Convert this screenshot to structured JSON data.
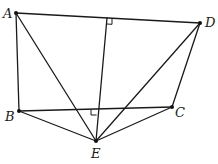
{
  "diagram": {
    "type": "geometry",
    "points": {
      "A": {
        "label": "A",
        "x": 16,
        "y": 13,
        "label_x": 3,
        "label_y": 18
      },
      "B": {
        "label": "B",
        "x": 19,
        "y": 111,
        "label_x": 5,
        "label_y": 121
      },
      "C": {
        "label": "C",
        "x": 172,
        "y": 107,
        "label_x": 175,
        "label_y": 116
      },
      "D": {
        "label": "D",
        "x": 200,
        "y": 23,
        "label_x": 205,
        "label_y": 27
      },
      "E": {
        "label": "E",
        "x": 96,
        "y": 141,
        "label_x": 91,
        "label_y": 158
      }
    },
    "segments": [
      [
        "A",
        "D"
      ],
      [
        "A",
        "B"
      ],
      [
        "B",
        "C"
      ],
      [
        "C",
        "D"
      ],
      [
        "A",
        "E"
      ],
      [
        "B",
        "E"
      ],
      [
        "C",
        "E"
      ],
      [
        "D",
        "E"
      ]
    ],
    "perpendiculars": [
      {
        "from": "E",
        "to_segment": [
          "A",
          "D"
        ],
        "foot": {
          "x": 107,
          "y": 18
        },
        "right_angle_mark": true
      },
      {
        "from": "E",
        "to_segment": [
          "B",
          "C"
        ],
        "foot": {
          "x": 97,
          "y": 109
        },
        "right_angle_mark": true
      }
    ],
    "colors": {
      "stroke": "#1a1a1a",
      "background": "#ffffff"
    }
  }
}
